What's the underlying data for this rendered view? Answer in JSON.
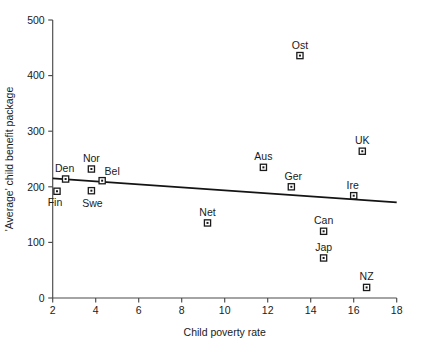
{
  "chart_data": {
    "type": "scatter",
    "title": "",
    "xlabel": "Child poverty rate",
    "ylabel": "'Average' child benefit package",
    "xlim": [
      2,
      18
    ],
    "ylim": [
      0,
      500
    ],
    "xticks": [
      2,
      4,
      6,
      8,
      10,
      12,
      14,
      16,
      18
    ],
    "yticks": [
      0,
      100,
      200,
      300,
      400,
      500
    ],
    "grid": false,
    "legend": "none",
    "points": [
      {
        "label": "Fin",
        "x": 2.2,
        "y": 192,
        "label_dx": -2,
        "label_dy": 15
      },
      {
        "label": "Den",
        "x": 2.6,
        "y": 214,
        "label_dx": -1,
        "label_dy": -7
      },
      {
        "label": "Nor",
        "x": 3.8,
        "y": 232,
        "label_dx": 0,
        "label_dy": -7
      },
      {
        "label": "Swe",
        "x": 3.8,
        "y": 193,
        "label_dx": 1,
        "label_dy": 16
      },
      {
        "label": "Bel",
        "x": 4.3,
        "y": 211,
        "label_dx": 10,
        "label_dy": -6
      },
      {
        "label": "Net",
        "x": 9.2,
        "y": 135,
        "label_dx": 0,
        "label_dy": -7
      },
      {
        "label": "Aus",
        "x": 11.8,
        "y": 235,
        "label_dx": 0,
        "label_dy": -7
      },
      {
        "label": "Ger",
        "x": 13.1,
        "y": 200,
        "label_dx": 2,
        "label_dy": -7
      },
      {
        "label": "Ost",
        "x": 13.5,
        "y": 436,
        "label_dx": 0,
        "label_dy": -7
      },
      {
        "label": "Can",
        "x": 14.6,
        "y": 120,
        "label_dx": 0,
        "label_dy": -7
      },
      {
        "label": "Jap",
        "x": 14.6,
        "y": 72,
        "label_dx": 0,
        "label_dy": -7
      },
      {
        "label": "Ire",
        "x": 16.0,
        "y": 184,
        "label_dx": -1,
        "label_dy": -7
      },
      {
        "label": "UK",
        "x": 16.4,
        "y": 264,
        "label_dx": 0,
        "label_dy": -7
      },
      {
        "label": "NZ",
        "x": 16.6,
        "y": 19,
        "label_dx": 0,
        "label_dy": -7
      }
    ],
    "trendline": {
      "x0": 2.0,
      "y0": 215,
      "x1": 18.0,
      "y1": 172
    }
  }
}
